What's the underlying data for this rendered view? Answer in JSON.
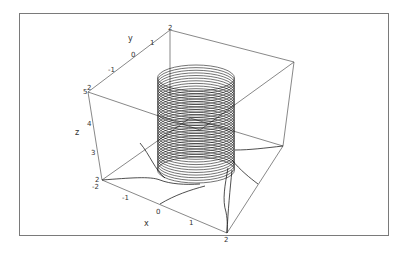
{
  "chart_data": {
    "type": "line3d",
    "title": "",
    "xlabel": "x",
    "ylabel": "y",
    "zlabel": "z",
    "x_ticks": [
      "-2",
      "-1",
      "0",
      "1",
      "2"
    ],
    "y_ticks": [
      "-1",
      "0",
      "1",
      "2"
    ],
    "z_ticks": [
      "2",
      "3",
      "4",
      "5"
    ],
    "xlim": [
      -2,
      2
    ],
    "ylim": [
      -2,
      2
    ],
    "zlim": [
      2,
      5
    ],
    "series": [
      {
        "name": "helix",
        "turns": 36,
        "radius": 1,
        "z_range": [
          2.5,
          5
        ],
        "color": "#000000"
      }
    ],
    "box": true,
    "grid": false,
    "legend": null
  },
  "labels": {
    "x_axis": "x",
    "y_axis": "y",
    "z_axis": "z",
    "x_tick_neg2": "-2",
    "x_tick_neg1": "-1",
    "x_tick_0": "0",
    "x_tick_1": "1",
    "x_tick_2": "2",
    "y_tick_neg1": "-1",
    "y_tick_0": "0",
    "y_tick_1": "1",
    "y_tick_2": "2",
    "z_tick_2": "2",
    "z_tick_3": "3",
    "z_tick_4": "4",
    "z_tick_5": "5",
    "z_tick_top": "2"
  },
  "colors": {
    "frame": "#7a7a7a",
    "box": "#555555",
    "curve": "#111111"
  }
}
